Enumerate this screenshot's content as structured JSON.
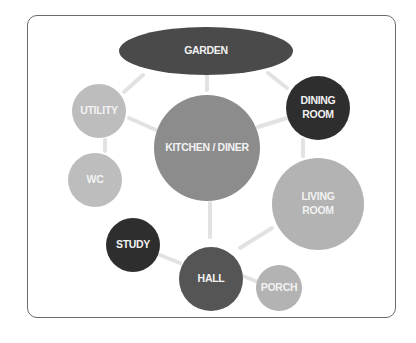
{
  "diagram": {
    "type": "bubble-adjacency",
    "frame": {
      "border_color": "#6a6a6a",
      "background": "#ffffff"
    },
    "edge_color": "#e2e2e2",
    "nodes": [
      {
        "id": "garden",
        "label": [
          "GARDEN"
        ],
        "shape": "ellipse",
        "cx": 206,
        "cy": 51,
        "rx": 87,
        "ry": 24,
        "fill": "#4a4a4a"
      },
      {
        "id": "kitchen",
        "label": [
          "KITCHEN / DINER"
        ],
        "shape": "circle",
        "cx": 207,
        "cy": 148,
        "r": 53,
        "fill": "#8c8c8c"
      },
      {
        "id": "utility",
        "label": [
          "UTILITY"
        ],
        "shape": "circle",
        "cx": 99,
        "cy": 111,
        "r": 27,
        "fill": "#bdbdbd"
      },
      {
        "id": "wc",
        "label": [
          "WC"
        ],
        "shape": "circle",
        "cx": 95,
        "cy": 180,
        "r": 27,
        "fill": "#bdbdbd"
      },
      {
        "id": "dining",
        "label": [
          "DINING",
          "ROOM"
        ],
        "shape": "circle",
        "cx": 318,
        "cy": 108,
        "r": 32,
        "fill": "#2e2e2e"
      },
      {
        "id": "living",
        "label": [
          "LIVING",
          "ROOM"
        ],
        "shape": "circle",
        "cx": 318,
        "cy": 204,
        "r": 46,
        "fill": "#b3b3b3"
      },
      {
        "id": "study",
        "label": [
          "STUDY"
        ],
        "shape": "circle",
        "cx": 133,
        "cy": 245,
        "r": 27,
        "fill": "#2e2e2e"
      },
      {
        "id": "hall",
        "label": [
          "HALL"
        ],
        "shape": "circle",
        "cx": 211,
        "cy": 279,
        "r": 32,
        "fill": "#555555"
      },
      {
        "id": "porch",
        "label": [
          "PORCH"
        ],
        "shape": "circle",
        "cx": 279,
        "cy": 288,
        "r": 23,
        "fill": "#b3b3b3"
      }
    ],
    "edges": [
      {
        "from": "garden",
        "to": "utility",
        "x1": 143,
        "y1": 75,
        "x2": 124,
        "y2": 92
      },
      {
        "from": "garden",
        "to": "kitchen",
        "x1": 207,
        "y1": 75,
        "x2": 207,
        "y2": 90
      },
      {
        "from": "garden",
        "to": "dining",
        "x1": 268,
        "y1": 73,
        "x2": 287,
        "y2": 88
      },
      {
        "from": "utility",
        "to": "kitchen",
        "x1": 129,
        "y1": 118,
        "x2": 156,
        "y2": 130
      },
      {
        "from": "utility",
        "to": "wc",
        "x1": 105,
        "y1": 140,
        "x2": 105,
        "y2": 151
      },
      {
        "from": "kitchen",
        "to": "dining",
        "x1": 258,
        "y1": 127,
        "x2": 287,
        "y2": 118
      },
      {
        "from": "dining",
        "to": "living",
        "x1": 303,
        "y1": 140,
        "x2": 303,
        "y2": 156
      },
      {
        "from": "kitchen",
        "to": "hall",
        "x1": 210,
        "y1": 203,
        "x2": 210,
        "y2": 237
      },
      {
        "from": "living",
        "to": "hall",
        "x1": 272,
        "y1": 228,
        "x2": 240,
        "y2": 248
      },
      {
        "from": "study",
        "to": "hall",
        "x1": 160,
        "y1": 255,
        "x2": 180,
        "y2": 263
      },
      {
        "from": "hall",
        "to": "porch",
        "x1": 243,
        "y1": 276,
        "x2": 258,
        "y2": 282
      }
    ]
  }
}
